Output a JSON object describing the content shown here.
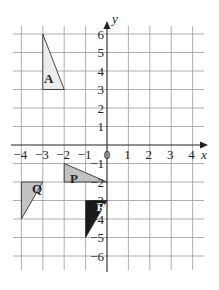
{
  "diagram": {
    "type": "coordinate-grid",
    "x_axis": {
      "label": "x",
      "min": -4,
      "max": 4,
      "ticks": [
        "-4",
        "-3",
        "-2",
        "-1",
        "0",
        "1",
        "2",
        "3",
        "4"
      ]
    },
    "y_axis": {
      "label": "y",
      "min": -6,
      "max": 6,
      "ticks": [
        "6",
        "5",
        "4",
        "3",
        "2",
        "1",
        "-1",
        "-2",
        "-3",
        "-4",
        "-5",
        "-6"
      ]
    },
    "colors": {
      "grid": "#9a9a9a",
      "axis": "#222222",
      "light_fill": "#ececec",
      "mid_fill": "#c2c2c2",
      "dark_fill": "#1a1a1a"
    },
    "shapes": [
      {
        "label": "A",
        "vertices": [
          [
            -3,
            6
          ],
          [
            -3,
            3
          ],
          [
            -2,
            3
          ]
        ],
        "fill": "#ececec",
        "label_color": "#222222"
      },
      {
        "label": "P",
        "vertices": [
          [
            -2,
            -1
          ],
          [
            -2,
            -2
          ],
          [
            0,
            -2
          ]
        ],
        "fill": "#c2c2c2",
        "label_color": "#222222"
      },
      {
        "label": "Q",
        "vertices": [
          [
            -4,
            -2
          ],
          [
            -3,
            -2
          ],
          [
            -4,
            -4
          ]
        ],
        "fill": "#c2c2c2",
        "label_color": "#222222"
      },
      {
        "label": "R",
        "vertices": [
          [
            -1,
            -3
          ],
          [
            0,
            -3
          ],
          [
            -1,
            -5
          ]
        ],
        "fill": "#1a1a1a",
        "label_color": "#ffffff"
      }
    ]
  }
}
